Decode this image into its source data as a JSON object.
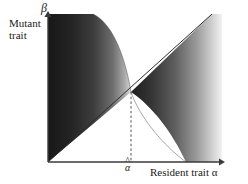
{
  "figure": {
    "type": "pairwise-invasibility-plot",
    "title": "",
    "axes": {
      "x": {
        "label": "Resident trait",
        "symbol": "α",
        "label_full": "Resident trait α",
        "tick_label": "α̂",
        "tick_base": "α",
        "tick_value_name": "alpha-hat",
        "origin_px": [
          48,
          162
        ],
        "arrow_end_px": [
          222,
          162
        ],
        "range": [
          0,
          1
        ],
        "arrow": true
      },
      "y": {
        "label": "Mutant trait",
        "symbol": "β",
        "label_line1": "Mutant",
        "label_line2": "trait",
        "origin_px": [
          48,
          162
        ],
        "arrow_end_px": [
          48,
          14
        ],
        "range": [
          0,
          1
        ],
        "arrow": true
      }
    },
    "singular_point": {
      "name": "singular-strategy",
      "label": "α̂",
      "px": [
        131,
        92
      ],
      "x_fraction": 0.477,
      "y_fraction": 0.473
    },
    "diagonal": {
      "name": "identity-line",
      "description": "beta = alpha",
      "from_px": [
        48,
        162
      ],
      "to_px": [
        212,
        14
      ]
    },
    "dashed_drop_line": {
      "name": "alpha-hat-dropline",
      "from_px": [
        131,
        92
      ],
      "to_px": [
        131,
        162
      ],
      "style": "dashed"
    },
    "regions": [
      {
        "name": "upper-left-invasion-region",
        "sign": "positive",
        "shading": "dark-to-light gradient, darkest at left edge",
        "bounded_by": [
          "y-axis",
          "top edge",
          "curved boundary",
          "identity-line"
        ],
        "dark_color": "#1c1c1c",
        "light_color": "#cfcfcf"
      },
      {
        "name": "lower-right-invasion-region",
        "sign": "positive",
        "shading": "dark-to-light gradient, darkest at upper-left near singular point",
        "bounded_by": [
          "identity-line",
          "curved boundary",
          "x-axis",
          "right edge"
        ],
        "dark_color": "#222222",
        "light_color": "#e8e8e8"
      }
    ],
    "curve": {
      "name": "invasion-boundary-curve",
      "description": "decreasing curve through the singular point",
      "top_px": [
        93,
        14
      ],
      "mid_px": [
        131,
        92
      ],
      "bottom_px": [
        186,
        162
      ]
    },
    "colors": {
      "axis": "#3a3a3a",
      "dashed": "#555555",
      "background": "#ffffff",
      "text": "#1a1a1a"
    }
  }
}
